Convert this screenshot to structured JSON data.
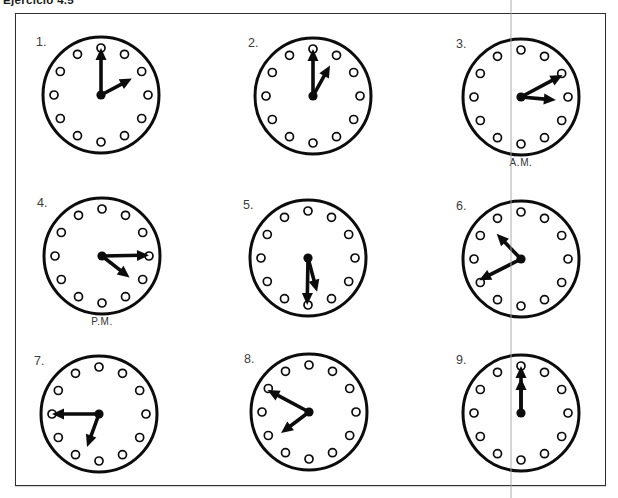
{
  "page": {
    "title": "Ejercicio 4.5",
    "background": "#ffffff",
    "ink_color": "#0c0c0c"
  },
  "chart_data": {
    "type": "table",
    "categories": [
      "1.",
      "2.",
      "3.",
      "4.",
      "5.",
      "6.",
      "7.",
      "8.",
      "9."
    ],
    "values": [
      "2:00",
      "1:00",
      "3:10",
      "4:15",
      "5:30",
      "10:40",
      "6:45",
      "7:50",
      "12:00"
    ]
  },
  "clocks": [
    {
      "label": "1.",
      "time_shown": "2:00",
      "hour_angle": 62,
      "minute_angle": 0,
      "sublabel": ""
    },
    {
      "label": "2.",
      "time_shown": "1:00",
      "hour_angle": 29,
      "minute_angle": 0,
      "sublabel": ""
    },
    {
      "label": "3.",
      "time_shown": "3:10",
      "hour_angle": 95,
      "minute_angle": 62,
      "sublabel": "A.M."
    },
    {
      "label": "4.",
      "time_shown": "4:15",
      "hour_angle": 128,
      "minute_angle": 89,
      "sublabel": "P.M."
    },
    {
      "label": "5.",
      "time_shown": "5:30",
      "hour_angle": 165,
      "minute_angle": 181,
      "sublabel": ""
    },
    {
      "label": "6.",
      "time_shown": "10:40",
      "hour_angle": 316,
      "minute_angle": 243,
      "sublabel": ""
    },
    {
      "label": "7.",
      "time_shown": "6:45",
      "hour_angle": 200,
      "minute_angle": 270,
      "sublabel": ""
    },
    {
      "label": "8.",
      "time_shown": "7:50",
      "hour_angle": 233,
      "minute_angle": 298,
      "sublabel": ""
    },
    {
      "label": "9.",
      "time_shown": "12:00",
      "hour_angle": 0,
      "minute_angle": 0,
      "sublabel": ""
    }
  ]
}
